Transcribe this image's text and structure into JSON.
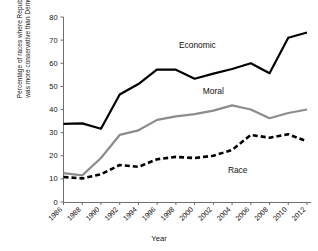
{
  "chart_data": {
    "type": "line",
    "title": "",
    "xlabel": "Year",
    "ylabel_line1": "Percentage of races where Republican",
    "ylabel_line2": "was more conservative than Democrat",
    "ylabel": "Percentage of races where Republican was more conservative than Democrat",
    "categories": [
      "1986",
      "1988",
      "1990",
      "1992",
      "1994",
      "1996",
      "1998",
      "2000",
      "2002",
      "2004",
      "2006",
      "2008",
      "2010",
      "2012"
    ],
    "x": [
      1986,
      1988,
      1990,
      1992,
      1994,
      1996,
      1998,
      2000,
      2002,
      2004,
      2006,
      2008,
      2010,
      2012
    ],
    "ylim": [
      0,
      80
    ],
    "yticks": [
      0,
      10,
      20,
      30,
      40,
      50,
      60,
      70,
      80
    ],
    "grid": false,
    "legend_position": "inline-annotations",
    "series": [
      {
        "name": "Economic",
        "color": "#000000",
        "style": "solid",
        "values": [
          33.8,
          34.0,
          31.7,
          46.5,
          51.0,
          57.3,
          57.2,
          53.3,
          55.5,
          57.5,
          60.0,
          55.7,
          71.0,
          73.3
        ]
      },
      {
        "name": "Moral",
        "color": "#8c8c8c",
        "style": "solid",
        "values": [
          12.5,
          11.5,
          19.0,
          29.0,
          31.0,
          35.5,
          37.0,
          38.0,
          39.5,
          41.8,
          40.0,
          36.2,
          38.5,
          40.0
        ]
      },
      {
        "name": "Race",
        "color": "#000000",
        "style": "dashed",
        "values": [
          10.8,
          10.2,
          12.0,
          16.0,
          15.2,
          18.5,
          19.5,
          19.0,
          20.0,
          22.5,
          29.0,
          27.8,
          29.3,
          26.2
        ]
      }
    ],
    "annotations": [
      {
        "text": "Economic",
        "x": 2000.3,
        "y": 66.5
      },
      {
        "text": "Moral",
        "x": 2002.0,
        "y": 46.5
      },
      {
        "text": "Race",
        "x": 2004.6,
        "y": 12.5
      }
    ]
  }
}
